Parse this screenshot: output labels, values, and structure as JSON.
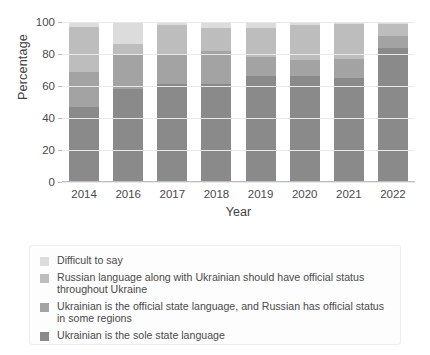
{
  "chart_data": {
    "type": "bar",
    "stacked": true,
    "title": "",
    "xlabel": "Year",
    "ylabel": "Percentage",
    "ylim": [
      0,
      100
    ],
    "yticks": [
      0,
      20,
      40,
      60,
      80,
      100
    ],
    "grid": true,
    "legend_position": "bottom",
    "categories": [
      "2014",
      "2016",
      "2017",
      "2018",
      "2019",
      "2020",
      "2021",
      "2022"
    ],
    "series": [
      {
        "name": "Ukrainian is the sole state language",
        "color": "#8a8a8a",
        "values": [
          47,
          58,
          61,
          61,
          66,
          66,
          65,
          84
        ]
      },
      {
        "name": "Ukrainian is the official state language, and Russian has official status in some regions",
        "color": "#a3a3a3",
        "values": [
          22,
          22,
          19,
          21,
          12,
          10,
          12,
          7
        ]
      },
      {
        "name": "Russian language along with Ukrainian should have official status throughout Ukraine",
        "color": "#bdbdbd",
        "values": [
          28,
          6,
          18,
          14,
          18,
          22,
          22,
          8
        ]
      },
      {
        "name": "Difficult to say",
        "color": "#dcdcdc",
        "values": [
          3,
          14,
          2,
          4,
          4,
          2,
          1,
          1
        ]
      }
    ]
  },
  "legend": {
    "items": [
      {
        "label": "Difficult to say",
        "color": "#dcdcdc"
      },
      {
        "label": "Russian language along with Ukrainian should have official status throughout Ukraine",
        "color": "#bdbdbd"
      },
      {
        "label": "Ukrainian is the official state language, and Russian has official status in some regions",
        "color": "#a3a3a3"
      },
      {
        "label": "Ukrainian is the sole state language",
        "color": "#8a8a8a"
      }
    ]
  }
}
